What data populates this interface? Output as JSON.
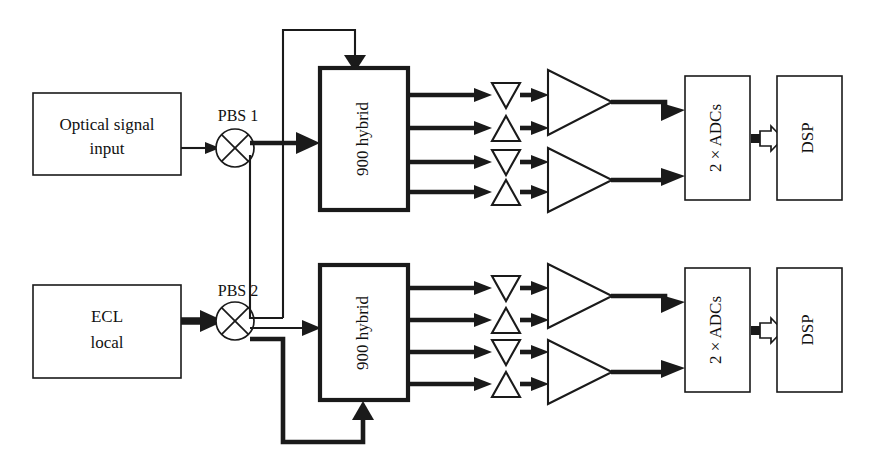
{
  "diagram": {
    "blocks": {
      "optical_signal_input": "Optical signal input",
      "optical_signal_input_line1": "Optical signal",
      "optical_signal_input_line2": "input",
      "ecl_local_line1": "ECL",
      "ecl_local_line2": "local",
      "pbs1": "PBS 1",
      "pbs2": "PBS 2",
      "hybrid_top": "900 hybrid",
      "hybrid_bottom": "900 hybrid",
      "adc_top": "2 × ADCs",
      "adc_bottom": "2 × ADCs",
      "dsp_top": "DSP",
      "dsp_bottom": "DSP"
    },
    "icons": {
      "pbs": "polarization-beam-splitter-icon",
      "photodiode_down": "photodiode-down-triangle-icon",
      "photodiode_up": "photodiode-up-triangle-icon",
      "amplifier": "amplifier-triangle-icon",
      "bus_arrow": "hollow-block-arrow-icon"
    },
    "colors": {
      "stroke": "#1a1a1a",
      "fill": "#ffffff",
      "background": "#ffffff"
    },
    "counts": {
      "hybrids": 2,
      "photodiodes_per_hybrid": 4,
      "amplifiers_per_hybrid": 2,
      "adc_blocks": 2,
      "dsp_blocks": 2
    }
  }
}
